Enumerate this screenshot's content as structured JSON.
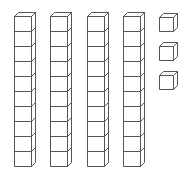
{
  "diagram": {
    "type": "base-ten-blocks",
    "tens_rods": 4,
    "cubes_per_rod": 10,
    "unit_cubes": 3,
    "represented_value": 43,
    "stroke_color": "#555555",
    "fill_color": "#ffffff"
  }
}
